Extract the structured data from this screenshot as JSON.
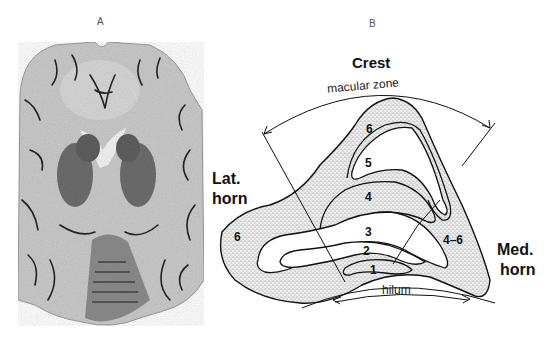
{
  "panels": {
    "a": {
      "label": "A",
      "content": "axial brain section photograph"
    },
    "b": {
      "label": "B"
    }
  },
  "diagram": {
    "top_title": "Crest",
    "arc_label": "macular zone",
    "left_label_line1": "Lat.",
    "left_label_line2": "horn",
    "right_label_line1": "Med.",
    "right_label_line2": "horn",
    "bottom_label": "hilum",
    "zones": {
      "outer_left": "6",
      "outer_top": "6",
      "z5": "5",
      "z4": "4",
      "z3": "3",
      "z2": "2",
      "z1": "1",
      "outer_right": "4–6"
    }
  },
  "colors": {
    "stipple": "#d9d9d9",
    "ink": "#111111"
  }
}
